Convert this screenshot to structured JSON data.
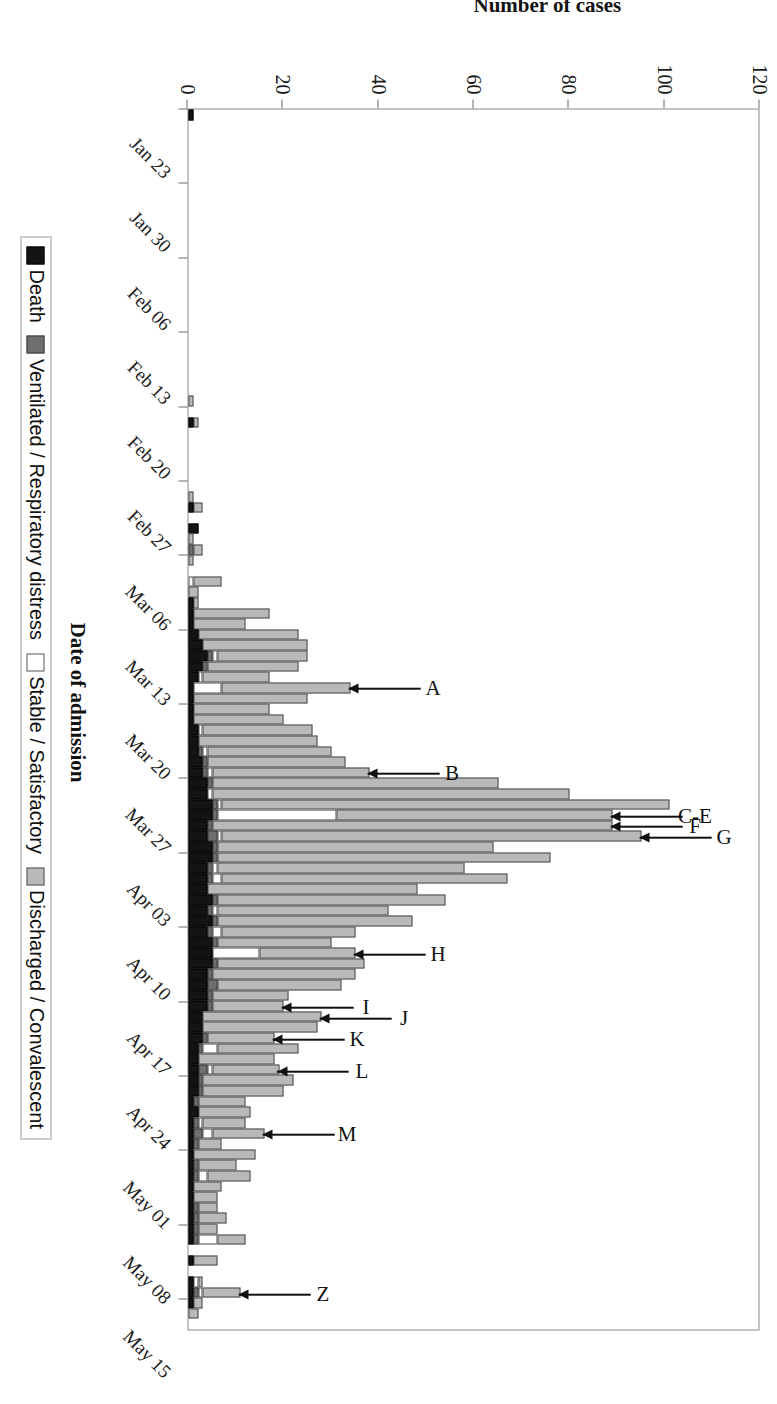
{
  "figure": {
    "x_axis_title": "Date of admission",
    "y_axis_title": "Number of cases"
  },
  "legend": {
    "position": "bottom",
    "items": [
      {
        "label": "Death",
        "color": "#141414",
        "swatch": "death-swatch"
      },
      {
        "label": "Ventilated / Respiratory distress",
        "color": "#6f6f6f",
        "swatch": "vent-swatch"
      },
      {
        "label": "Stable / Satisfactory",
        "color": "#ffffff",
        "swatch": "stable-swatch"
      },
      {
        "label": "Discharged / Convalescent",
        "color": "#b9b9b9",
        "swatch": "disch-swatch"
      }
    ]
  },
  "y_ticks": [
    "0",
    "20",
    "40",
    "60",
    "80",
    "100",
    "120"
  ],
  "x_ticks": [
    "Jan 23",
    "Jan 30",
    "Feb 06",
    "Feb 13",
    "Feb 20",
    "Feb 27",
    "Mar 06",
    "Mar 13",
    "Mar 20",
    "Mar 27",
    "Apr 03",
    "Apr 10",
    "Apr 17",
    "Apr 24",
    "May 01",
    "May 08",
    "May 15"
  ],
  "annotations": [
    {
      "label": "A",
      "bar_index": 54
    },
    {
      "label": "B",
      "bar_index": 62
    },
    {
      "label": "C-E",
      "bar_index": 66
    },
    {
      "label": "F",
      "bar_index": 67
    },
    {
      "label": "G",
      "bar_index": 68
    },
    {
      "label": "H",
      "bar_index": 79
    },
    {
      "label": "I",
      "bar_index": 84
    },
    {
      "label": "J",
      "bar_index": 85
    },
    {
      "label": "K",
      "bar_index": 87
    },
    {
      "label": "L",
      "bar_index": 90
    },
    {
      "label": "M",
      "bar_index": 96
    },
    {
      "label": "Z",
      "bar_index": 111
    }
  ],
  "chart_data": {
    "type": "bar",
    "subtype": "stacked-bar",
    "orientation": "vertical",
    "title": "",
    "xlabel": "Date of admission",
    "ylabel": "Number of cases",
    "ylim": [
      0,
      120
    ],
    "ytick_step": 20,
    "grid": false,
    "legend_position": "bottom",
    "series": [
      {
        "name": "Death",
        "color": "#141414"
      },
      {
        "name": "Ventilated / Respiratory distress",
        "color": "#6f6f6f"
      },
      {
        "name": "Stable / Satisfactory",
        "color": "#ffffff"
      },
      {
        "name": "Discharged / Convalescent",
        "color": "#b9b9b9"
      }
    ],
    "x_tick_labels": [
      "Jan 23",
      "Jan 30",
      "Feb 06",
      "Feb 13",
      "Feb 20",
      "Feb 27",
      "Mar 06",
      "Mar 13",
      "Mar 20",
      "Mar 27",
      "Apr 03",
      "Apr 10",
      "Apr 17",
      "Apr 24",
      "May 01",
      "May 08",
      "May 15"
    ],
    "x_tick_interval_days": 7,
    "x_start": "Jan 23",
    "bars": [
      {
        "d": "Jan 23",
        "death": 1,
        "vent": 0,
        "stable": 0,
        "disch": 0
      },
      {
        "d": "Jan 24",
        "death": 0,
        "vent": 0,
        "stable": 0,
        "disch": 0
      },
      {
        "d": "Jan 25",
        "death": 0,
        "vent": 0,
        "stable": 0,
        "disch": 0
      },
      {
        "d": "Jan 26",
        "death": 0,
        "vent": 0,
        "stable": 0,
        "disch": 0
      },
      {
        "d": "Jan 27",
        "death": 0,
        "vent": 0,
        "stable": 0,
        "disch": 0
      },
      {
        "d": "Jan 28",
        "death": 0,
        "vent": 0,
        "stable": 0,
        "disch": 0
      },
      {
        "d": "Jan 29",
        "death": 0,
        "vent": 0,
        "stable": 0,
        "disch": 0
      },
      {
        "d": "Jan 30",
        "death": 0,
        "vent": 0,
        "stable": 0,
        "disch": 0
      },
      {
        "d": "Jan 31",
        "death": 0,
        "vent": 0,
        "stable": 0,
        "disch": 0
      },
      {
        "d": "Feb 01",
        "death": 0,
        "vent": 0,
        "stable": 0,
        "disch": 0
      },
      {
        "d": "Feb 02",
        "death": 0,
        "vent": 0,
        "stable": 0,
        "disch": 0
      },
      {
        "d": "Feb 03",
        "death": 0,
        "vent": 0,
        "stable": 0,
        "disch": 0
      },
      {
        "d": "Feb 04",
        "death": 0,
        "vent": 0,
        "stable": 0,
        "disch": 0
      },
      {
        "d": "Feb 05",
        "death": 0,
        "vent": 0,
        "stable": 0,
        "disch": 0
      },
      {
        "d": "Feb 06",
        "death": 0,
        "vent": 0,
        "stable": 0,
        "disch": 0
      },
      {
        "d": "Feb 07",
        "death": 0,
        "vent": 0,
        "stable": 0,
        "disch": 0
      },
      {
        "d": "Feb 08",
        "death": 0,
        "vent": 0,
        "stable": 0,
        "disch": 0
      },
      {
        "d": "Feb 09",
        "death": 0,
        "vent": 0,
        "stable": 0,
        "disch": 0
      },
      {
        "d": "Feb 10",
        "death": 0,
        "vent": 0,
        "stable": 0,
        "disch": 0
      },
      {
        "d": "Feb 11",
        "death": 0,
        "vent": 0,
        "stable": 0,
        "disch": 0
      },
      {
        "d": "Feb 12",
        "death": 0,
        "vent": 0,
        "stable": 0,
        "disch": 0
      },
      {
        "d": "Feb 13",
        "death": 0,
        "vent": 0,
        "stable": 0,
        "disch": 0
      },
      {
        "d": "Feb 14",
        "death": 0,
        "vent": 0,
        "stable": 0,
        "disch": 0
      },
      {
        "d": "Feb 15",
        "death": 0,
        "vent": 0,
        "stable": 0,
        "disch": 0
      },
      {
        "d": "Feb 16",
        "death": 0,
        "vent": 0,
        "stable": 0,
        "disch": 0
      },
      {
        "d": "Feb 17",
        "death": 0,
        "vent": 0,
        "stable": 0,
        "disch": 0
      },
      {
        "d": "Feb 18",
        "death": 0,
        "vent": 0,
        "stable": 0,
        "disch": 0
      },
      {
        "d": "Feb 19",
        "death": 0,
        "vent": 0,
        "stable": 0,
        "disch": 1
      },
      {
        "d": "Feb 20",
        "death": 0,
        "vent": 0,
        "stable": 0,
        "disch": 0
      },
      {
        "d": "Feb 21",
        "death": 1,
        "vent": 0,
        "stable": 0,
        "disch": 1
      },
      {
        "d": "Feb 22",
        "death": 0,
        "vent": 0,
        "stable": 0,
        "disch": 0
      },
      {
        "d": "Feb 23",
        "death": 0,
        "vent": 0,
        "stable": 0,
        "disch": 0
      },
      {
        "d": "Feb 24",
        "death": 0,
        "vent": 0,
        "stable": 0,
        "disch": 0
      },
      {
        "d": "Feb 25",
        "death": 0,
        "vent": 0,
        "stable": 0,
        "disch": 0
      },
      {
        "d": "Feb 26",
        "death": 0,
        "vent": 0,
        "stable": 0,
        "disch": 0
      },
      {
        "d": "Feb 27",
        "death": 0,
        "vent": 0,
        "stable": 0,
        "disch": 0
      },
      {
        "d": "Feb 28",
        "death": 0,
        "vent": 0,
        "stable": 0,
        "disch": 1
      },
      {
        "d": "Mar 01",
        "death": 1,
        "vent": 0,
        "stable": 0,
        "disch": 2
      },
      {
        "d": "Mar 02",
        "death": 0,
        "vent": 0,
        "stable": 0,
        "disch": 0
      },
      {
        "d": "Mar 03",
        "death": 2,
        "vent": 0,
        "stable": 0,
        "disch": 0
      },
      {
        "d": "Mar 04",
        "death": 0,
        "vent": 0,
        "stable": 0,
        "disch": 1
      },
      {
        "d": "Mar 05",
        "death": 0,
        "vent": 1,
        "stable": 0,
        "disch": 2
      },
      {
        "d": "Mar 06",
        "death": 0,
        "vent": 0,
        "stable": 0,
        "disch": 1
      },
      {
        "d": "Mar 07",
        "death": 0,
        "vent": 0,
        "stable": 0,
        "disch": 0
      },
      {
        "d": "Mar 08",
        "death": 0,
        "vent": 0,
        "stable": 1,
        "disch": 6
      },
      {
        "d": "Mar 09",
        "death": 0,
        "vent": 0,
        "stable": 0,
        "disch": 2
      },
      {
        "d": "Mar 10",
        "death": 1,
        "vent": 0,
        "stable": 0,
        "disch": 1
      },
      {
        "d": "Mar 11",
        "death": 1,
        "vent": 0,
        "stable": 0,
        "disch": 16
      },
      {
        "d": "Mar 12",
        "death": 1,
        "vent": 0,
        "stable": 0,
        "disch": 11
      },
      {
        "d": "Mar 13",
        "death": 2,
        "vent": 0,
        "stable": 0,
        "disch": 21
      },
      {
        "d": "Mar 14",
        "death": 3,
        "vent": 0,
        "stable": 0,
        "disch": 22
      },
      {
        "d": "Mar 15",
        "death": 4,
        "vent": 1,
        "stable": 1,
        "disch": 19
      },
      {
        "d": "Mar 16",
        "death": 3,
        "vent": 1,
        "stable": 0,
        "disch": 19
      },
      {
        "d": "Mar 17",
        "death": 2,
        "vent": 0,
        "stable": 1,
        "disch": 14
      },
      {
        "d": "Mar 18",
        "death": 1,
        "vent": 0,
        "stable": 6,
        "disch": 27
      },
      {
        "d": "Mar 19",
        "death": 1,
        "vent": 0,
        "stable": 0,
        "disch": 24
      },
      {
        "d": "Mar 20",
        "death": 1,
        "vent": 0,
        "stable": 0,
        "disch": 16
      },
      {
        "d": "Mar 21",
        "death": 1,
        "vent": 0,
        "stable": 0,
        "disch": 19
      },
      {
        "d": "Mar 22",
        "death": 2,
        "vent": 0,
        "stable": 1,
        "disch": 23
      },
      {
        "d": "Mar 23",
        "death": 2,
        "vent": 0,
        "stable": 0,
        "disch": 25
      },
      {
        "d": "Mar 24",
        "death": 2,
        "vent": 1,
        "stable": 1,
        "disch": 26
      },
      {
        "d": "Mar 25",
        "death": 3,
        "vent": 1,
        "stable": 0,
        "disch": 29
      },
      {
        "d": "Mar 26",
        "death": 3,
        "vent": 1,
        "stable": 1,
        "disch": 33
      },
      {
        "d": "Mar 27",
        "death": 4,
        "vent": 1,
        "stable": 0,
        "disch": 60
      },
      {
        "d": "Mar 28",
        "death": 4,
        "vent": 0,
        "stable": 1,
        "disch": 75
      },
      {
        "d": "Mar 29",
        "death": 5,
        "vent": 1,
        "stable": 1,
        "disch": 94
      },
      {
        "d": "Mar 30",
        "death": 5,
        "vent": 1,
        "stable": 25,
        "disch": 58
      },
      {
        "d": "Mar 31",
        "death": 4,
        "vent": 1,
        "stable": 0,
        "disch": 84
      },
      {
        "d": "Apr 01",
        "death": 4,
        "vent": 2,
        "stable": 1,
        "disch": 88
      },
      {
        "d": "Apr 02",
        "death": 5,
        "vent": 1,
        "stable": 0,
        "disch": 58
      },
      {
        "d": "Apr 03",
        "death": 5,
        "vent": 1,
        "stable": 0,
        "disch": 70
      },
      {
        "d": "Apr 04",
        "death": 4,
        "vent": 1,
        "stable": 1,
        "disch": 52
      },
      {
        "d": "Apr 05",
        "death": 4,
        "vent": 1,
        "stable": 2,
        "disch": 60
      },
      {
        "d": "Apr 06",
        "death": 4,
        "vent": 0,
        "stable": 0,
        "disch": 44
      },
      {
        "d": "Apr 07",
        "death": 5,
        "vent": 1,
        "stable": 0,
        "disch": 48
      },
      {
        "d": "Apr 08",
        "death": 4,
        "vent": 1,
        "stable": 1,
        "disch": 36
      },
      {
        "d": "Apr 09",
        "death": 5,
        "vent": 1,
        "stable": 0,
        "disch": 41
      },
      {
        "d": "Apr 10",
        "death": 4,
        "vent": 1,
        "stable": 2,
        "disch": 28
      },
      {
        "d": "Apr 11",
        "death": 5,
        "vent": 1,
        "stable": 0,
        "disch": 24
      },
      {
        "d": "Apr 12",
        "death": 5,
        "vent": 0,
        "stable": 10,
        "disch": 20
      },
      {
        "d": "Apr 13",
        "death": 5,
        "vent": 1,
        "stable": 0,
        "disch": 31
      },
      {
        "d": "Apr 14",
        "death": 4,
        "vent": 1,
        "stable": 0,
        "disch": 30
      },
      {
        "d": "Apr 15",
        "death": 4,
        "vent": 2,
        "stable": 0,
        "disch": 26
      },
      {
        "d": "Apr 16",
        "death": 4,
        "vent": 1,
        "stable": 0,
        "disch": 16
      },
      {
        "d": "Apr 17",
        "death": 4,
        "vent": 1,
        "stable": 0,
        "disch": 15
      },
      {
        "d": "Apr 18",
        "death": 3,
        "vent": 0,
        "stable": 0,
        "disch": 25
      },
      {
        "d": "Apr 19",
        "death": 3,
        "vent": 0,
        "stable": 0,
        "disch": 24
      },
      {
        "d": "Apr 20",
        "death": 3,
        "vent": 1,
        "stable": 0,
        "disch": 14
      },
      {
        "d": "Apr 21",
        "death": 2,
        "vent": 1,
        "stable": 3,
        "disch": 17
      },
      {
        "d": "Apr 22",
        "death": 2,
        "vent": 0,
        "stable": 0,
        "disch": 16
      },
      {
        "d": "Apr 23",
        "death": 2,
        "vent": 2,
        "stable": 1,
        "disch": 14
      },
      {
        "d": "Apr 24",
        "death": 2,
        "vent": 1,
        "stable": 0,
        "disch": 19
      },
      {
        "d": "Apr 25",
        "death": 2,
        "vent": 1,
        "stable": 0,
        "disch": 17
      },
      {
        "d": "Apr 26",
        "death": 1,
        "vent": 1,
        "stable": 0,
        "disch": 10
      },
      {
        "d": "Apr 27",
        "death": 2,
        "vent": 0,
        "stable": 0,
        "disch": 11
      },
      {
        "d": "Apr 28",
        "death": 1,
        "vent": 1,
        "stable": 1,
        "disch": 9
      },
      {
        "d": "Apr 29",
        "death": 1,
        "vent": 2,
        "stable": 2,
        "disch": 11
      },
      {
        "d": "Apr 30",
        "death": 1,
        "vent": 1,
        "stable": 0,
        "disch": 5
      },
      {
        "d": "May 01",
        "death": 1,
        "vent": 0,
        "stable": 0,
        "disch": 13
      },
      {
        "d": "May 02",
        "death": 1,
        "vent": 1,
        "stable": 0,
        "disch": 8
      },
      {
        "d": "May 03",
        "death": 1,
        "vent": 1,
        "stable": 2,
        "disch": 9
      },
      {
        "d": "May 04",
        "death": 1,
        "vent": 0,
        "stable": 0,
        "disch": 6
      },
      {
        "d": "May 05",
        "death": 1,
        "vent": 0,
        "stable": 0,
        "disch": 5
      },
      {
        "d": "May 06",
        "death": 1,
        "vent": 1,
        "stable": 0,
        "disch": 4
      },
      {
        "d": "May 07",
        "death": 1,
        "vent": 1,
        "stable": 0,
        "disch": 6
      },
      {
        "d": "May 08",
        "death": 1,
        "vent": 1,
        "stable": 0,
        "disch": 4
      },
      {
        "d": "May 09",
        "death": 1,
        "vent": 1,
        "stable": 4,
        "disch": 6
      },
      {
        "d": "May 10",
        "death": 0,
        "vent": 0,
        "stable": 0,
        "disch": 0
      },
      {
        "d": "May 11",
        "death": 1,
        "vent": 0,
        "stable": 0,
        "disch": 5
      },
      {
        "d": "May 12",
        "death": 0,
        "vent": 0,
        "stable": 0,
        "disch": 0
      },
      {
        "d": "May 13",
        "death": 1,
        "vent": 0,
        "stable": 1,
        "disch": 1
      },
      {
        "d": "May 14",
        "death": 1,
        "vent": 1,
        "stable": 1,
        "disch": 8
      },
      {
        "d": "May 15",
        "death": 1,
        "vent": 0,
        "stable": 0,
        "disch": 2
      },
      {
        "d": "May 16",
        "death": 0,
        "vent": 0,
        "stable": 0,
        "disch": 2
      },
      {
        "d": "May 17",
        "death": 0,
        "vent": 0,
        "stable": 0,
        "disch": 0
      }
    ]
  }
}
